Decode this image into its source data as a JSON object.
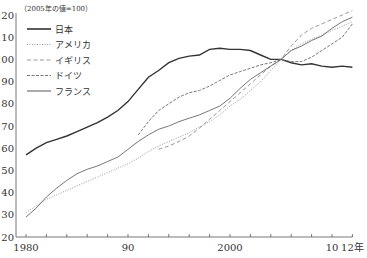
{
  "chart_data": {
    "type": "line",
    "title": "",
    "unit_note": "（2005年の値=100）",
    "xlabel": "",
    "ylabel": "",
    "x": [
      1980,
      1981,
      1982,
      1983,
      1984,
      1985,
      1986,
      1987,
      1988,
      1989,
      1990,
      1991,
      1992,
      1993,
      1994,
      1995,
      1996,
      1997,
      1998,
      1999,
      2000,
      2001,
      2002,
      2003,
      2004,
      2005,
      2006,
      2007,
      2008,
      2009,
      2010,
      2011,
      2012
    ],
    "xlim": [
      1980,
      2012
    ],
    "ylim": [
      20,
      120
    ],
    "x_tick_labels": [
      {
        "value": 1980,
        "label": "1980"
      },
      {
        "value": 1990,
        "label": "90"
      },
      {
        "value": 2000,
        "label": "2000"
      },
      {
        "value": 2010,
        "label": "10"
      },
      {
        "value": 2012,
        "label": "12年"
      }
    ],
    "y_ticks": [
      20,
      30,
      40,
      50,
      60,
      70,
      80,
      90,
      100,
      110,
      120
    ],
    "grid": false,
    "legend_position": "upper-left",
    "series": [
      {
        "name": "日本",
        "style": "solid",
        "color": "#333333",
        "width": 1.4,
        "values": [
          57,
          60,
          62.5,
          64,
          65.5,
          67.5,
          69.5,
          71.5,
          74,
          77,
          81,
          86.5,
          92,
          95,
          98.5,
          100.5,
          101.5,
          102,
          104.5,
          105,
          104.5,
          104.5,
          104,
          102,
          100,
          100,
          98.5,
          97.5,
          98,
          97,
          96.5,
          97,
          96.5
        ]
      },
      {
        "name": "アメリカ",
        "style": "dotted",
        "color": "#999999",
        "width": 1,
        "values": [
          31,
          34,
          37,
          39,
          41,
          43,
          45,
          47,
          49,
          51,
          53,
          55.5,
          58.5,
          61,
          63,
          65,
          67,
          69.5,
          72,
          75,
          79,
          82,
          86,
          90,
          95,
          100,
          104,
          107,
          109,
          111,
          113,
          115,
          117
        ]
      },
      {
        "name": "イギリス",
        "style": "dashed",
        "color": "#999999",
        "width": 1,
        "values": [
          null,
          null,
          null,
          null,
          null,
          null,
          null,
          null,
          null,
          null,
          null,
          null,
          null,
          59.5,
          61,
          63,
          65.5,
          69,
          73,
          77,
          81,
          85,
          89,
          93,
          97,
          100,
          106,
          111,
          114,
          116,
          118,
          120,
          122
        ]
      },
      {
        "name": "ドイツ",
        "style": "dashdot",
        "color": "#777777",
        "width": 1,
        "values": [
          null,
          null,
          null,
          null,
          null,
          null,
          null,
          null,
          null,
          null,
          null,
          66,
          72,
          77,
          80,
          83,
          85,
          86,
          88,
          90.5,
          93,
          94.5,
          96,
          97.5,
          98.5,
          100,
          99,
          99,
          101,
          104,
          107,
          110,
          116
        ]
      },
      {
        "name": "フランス",
        "style": "solid-thin",
        "color": "#666666",
        "width": 0.9,
        "values": [
          29,
          33,
          38,
          42,
          45.5,
          48.5,
          50.5,
          52,
          54,
          56,
          59.5,
          63,
          66,
          68.5,
          70,
          72,
          73.5,
          75,
          77,
          79,
          82.5,
          87,
          91,
          94,
          97,
          100,
          104,
          106,
          108.5,
          110.5,
          114,
          117,
          119
        ]
      }
    ]
  }
}
